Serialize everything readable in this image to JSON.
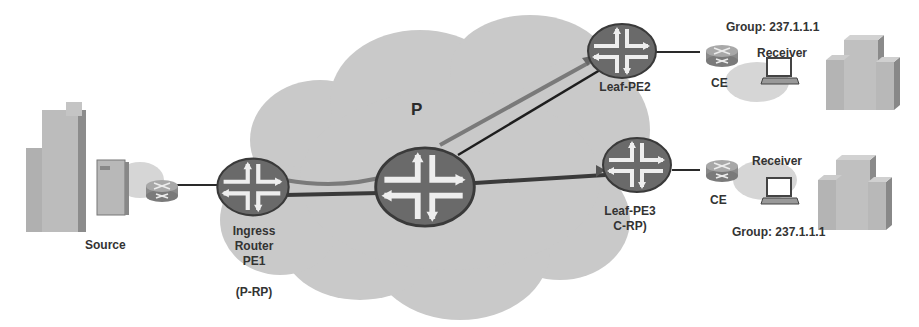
{
  "diagram": {
    "cloud_label": "P",
    "source": {
      "label": "Source"
    },
    "ingress": {
      "line1": "Ingress",
      "line2": "Router",
      "line3": "PE1",
      "role": "(P-RP)"
    },
    "leaf_pe2": {
      "label": "Leaf-PE2"
    },
    "leaf_pe3": {
      "label": "Leaf-PE3",
      "role": "C-RP)"
    },
    "receiver_top": {
      "ce_label": "CE",
      "receiver_label": "Receiver",
      "group": "Group: 237.1.1.1"
    },
    "receiver_bottom": {
      "ce_label": "CE",
      "receiver_label": "Receiver",
      "group": "Group: 237.1.1.1"
    },
    "colors": {
      "cloud": "#c8c8c8",
      "router_fill": "#6e6e6e",
      "router_arrows": "#f0f0f0",
      "link_dark": "#2a2a2a",
      "link_grey": "#7a7a7a",
      "building": "#b0b0b0",
      "text": "#333333"
    }
  }
}
